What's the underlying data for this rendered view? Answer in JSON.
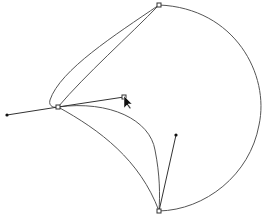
{
  "canvas": {
    "width": 264,
    "height": 217,
    "background": "#ffffff",
    "stroke_color": "#555555"
  },
  "anchors": [
    {
      "name": "top-anchor",
      "x": 159,
      "y": 5
    },
    {
      "name": "left-anchor",
      "x": 58,
      "y": 107
    },
    {
      "name": "bottom-anchor",
      "x": 159,
      "y": 211
    }
  ],
  "handles": [
    {
      "name": "left-handle-out",
      "from": [
        58,
        107
      ],
      "to": [
        7,
        115
      ]
    },
    {
      "name": "left-handle-in",
      "from": [
        58,
        107
      ],
      "to": [
        124,
        97
      ]
    },
    {
      "name": "bottom-handle",
      "from": [
        159,
        211
      ],
      "to": [
        176,
        135
      ]
    }
  ],
  "cursor": {
    "type": "arrow-pointer",
    "x": 124,
    "y": 97
  }
}
